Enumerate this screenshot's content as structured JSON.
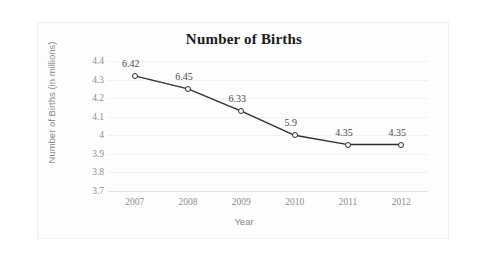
{
  "chart_data": {
    "type": "line",
    "title": "Number of Births",
    "xlabel": "Year",
    "ylabel": "Number of Births (in millions)",
    "categories": [
      "2007",
      "2008",
      "2009",
      "2010",
      "2011",
      "2012"
    ],
    "values": [
      4.32,
      4.25,
      4.13,
      4.0,
      3.95,
      3.95
    ],
    "point_labels": [
      "6.42",
      "6.45",
      "6.33",
      "5.9",
      "4.35",
      "4.35"
    ],
    "yticks": [
      "4.4",
      "4.3",
      "4.2",
      "4.1",
      "4",
      "3.9",
      "3.8",
      "3.7"
    ],
    "ylim": [
      3.7,
      4.4
    ],
    "grid": true,
    "legend": "none",
    "series_color": "#2e2e2e",
    "marker": "open-circle",
    "gridline_color": "#f2f2f2",
    "tick_label_color": "#8e8e8e",
    "axis_title_color": "#8a8a8a",
    "title_color": "#1a1a1a",
    "frame_color": "#f0f0f0",
    "background": "#ffffff"
  }
}
